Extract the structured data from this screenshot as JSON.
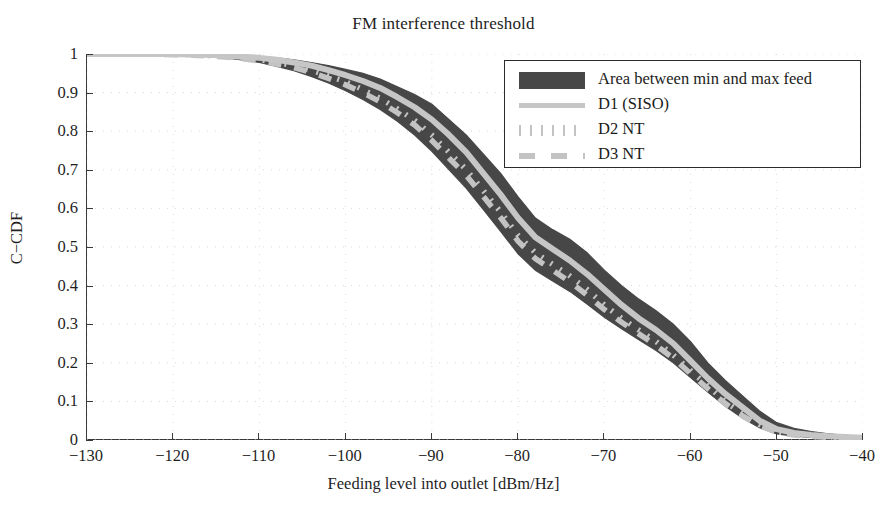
{
  "chart_data": {
    "type": "line",
    "title": "FM interference threshold",
    "xlabel": "Feeding level into outlet [dBm/Hz]",
    "ylabel": "C−CDF",
    "xlim": [
      -130,
      -40
    ],
    "ylim": [
      0,
      1
    ],
    "xticks": [
      -130,
      -120,
      -110,
      -100,
      -90,
      -80,
      -70,
      -60,
      -50,
      -40
    ],
    "xtick_labels": [
      "−130",
      "−120",
      "−110",
      "−100",
      "−90",
      "−80",
      "−70",
      "−60",
      "−50",
      "−40"
    ],
    "yticks": [
      0,
      0.1,
      0.2,
      0.3,
      0.4,
      0.5,
      0.6,
      0.7,
      0.8,
      0.9,
      1
    ],
    "ytick_labels": [
      "0",
      "0.1",
      "0.2",
      "0.3",
      "0.4",
      "0.5",
      "0.6",
      "0.7",
      "0.8",
      "0.9",
      "1"
    ],
    "grid": true,
    "grid_style": "dotted",
    "legend_position": "upper right",
    "legend": [
      {
        "label": "Area between min and max feed",
        "style": "patch",
        "color": "#474747"
      },
      {
        "label": "D1 (SISO)",
        "style": "solid",
        "color": "#c6c6c6"
      },
      {
        "label": "D2 NT",
        "style": "dotted",
        "color": "#c3c3c3"
      },
      {
        "label": "D3 NT",
        "style": "dashed",
        "color": "#c3c3c3"
      }
    ],
    "x": [
      -130,
      -127,
      -124,
      -121,
      -118,
      -116,
      -114,
      -112,
      -110,
      -108,
      -106,
      -104,
      -102,
      -100,
      -98,
      -96,
      -94,
      -92,
      -90,
      -88,
      -86,
      -84,
      -82,
      -80,
      -78,
      -76,
      -74,
      -72,
      -70,
      -68,
      -66,
      -64,
      -62,
      -60,
      -58,
      -56,
      -54,
      -52,
      -50,
      -48,
      -46,
      -44,
      -42,
      -40
    ],
    "series": [
      {
        "name": "max feed (upper band edge)",
        "values": [
          1.0,
          1.0,
          1.0,
          1.0,
          1.0,
          0.999,
          0.998,
          0.996,
          0.993,
          0.99,
          0.985,
          0.978,
          0.97,
          0.96,
          0.95,
          0.935,
          0.915,
          0.895,
          0.87,
          0.83,
          0.79,
          0.74,
          0.69,
          0.63,
          0.575,
          0.545,
          0.52,
          0.485,
          0.44,
          0.4,
          0.365,
          0.335,
          0.3,
          0.255,
          0.2,
          0.155,
          0.115,
          0.075,
          0.045,
          0.03,
          0.022,
          0.016,
          0.012,
          0.01
        ]
      },
      {
        "name": "D1 (SISO)",
        "values": [
          1.0,
          1.0,
          1.0,
          1.0,
          0.999,
          0.998,
          0.996,
          0.993,
          0.99,
          0.985,
          0.978,
          0.97,
          0.958,
          0.945,
          0.93,
          0.912,
          0.888,
          0.862,
          0.83,
          0.79,
          0.745,
          0.69,
          0.635,
          0.575,
          0.525,
          0.495,
          0.465,
          0.43,
          0.39,
          0.35,
          0.315,
          0.285,
          0.25,
          0.205,
          0.16,
          0.12,
          0.085,
          0.05,
          0.028,
          0.018,
          0.013,
          0.01,
          0.008,
          0.006
        ]
      },
      {
        "name": "D2 NT",
        "values": [
          1.0,
          1.0,
          1.0,
          0.999,
          0.998,
          0.996,
          0.993,
          0.99,
          0.985,
          0.978,
          0.97,
          0.958,
          0.943,
          0.928,
          0.908,
          0.885,
          0.858,
          0.828,
          0.79,
          0.745,
          0.7,
          0.645,
          0.59,
          0.53,
          0.485,
          0.455,
          0.425,
          0.39,
          0.35,
          0.315,
          0.285,
          0.255,
          0.22,
          0.18,
          0.14,
          0.1,
          0.068,
          0.04,
          0.022,
          0.014,
          0.01,
          0.008,
          0.006,
          0.005
        ]
      },
      {
        "name": "D3 NT",
        "values": [
          1.0,
          1.0,
          1.0,
          0.999,
          0.997,
          0.995,
          0.992,
          0.988,
          0.982,
          0.974,
          0.965,
          0.952,
          0.937,
          0.92,
          0.9,
          0.876,
          0.848,
          0.816,
          0.776,
          0.73,
          0.685,
          0.63,
          0.575,
          0.515,
          0.47,
          0.44,
          0.41,
          0.375,
          0.338,
          0.305,
          0.275,
          0.245,
          0.212,
          0.172,
          0.133,
          0.095,
          0.063,
          0.037,
          0.02,
          0.013,
          0.009,
          0.007,
          0.005,
          0.004
        ]
      },
      {
        "name": "min feed (lower band edge)",
        "values": [
          1.0,
          1.0,
          0.999,
          0.998,
          0.996,
          0.993,
          0.99,
          0.985,
          0.978,
          0.968,
          0.957,
          0.942,
          0.925,
          0.905,
          0.882,
          0.856,
          0.826,
          0.79,
          0.748,
          0.7,
          0.652,
          0.596,
          0.54,
          0.482,
          0.44,
          0.412,
          0.385,
          0.352,
          0.318,
          0.288,
          0.26,
          0.232,
          0.2,
          0.162,
          0.124,
          0.088,
          0.057,
          0.032,
          0.016,
          0.01,
          0.007,
          0.005,
          0.004,
          0.003
        ]
      }
    ]
  }
}
